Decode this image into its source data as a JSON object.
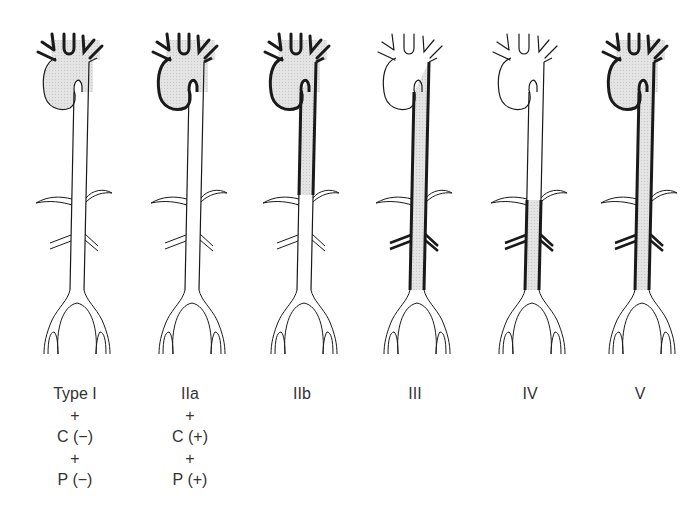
{
  "figure": {
    "colors": {
      "stroke": "#1a1a1a",
      "fill_involved": "#dcdcdc",
      "background": "#ffffff"
    }
  },
  "types": [
    {
      "id": "type-1",
      "label": "Type I",
      "lines": [
        "+",
        "C (−)",
        "+",
        "P (−)"
      ],
      "center_x": 75,
      "arch_filled": true,
      "arch_bold": false,
      "desc_filled": "none"
    },
    {
      "id": "type-2a",
      "label": "IIa",
      "lines": [
        "+",
        "C (+)",
        "+",
        "P (+)"
      ],
      "center_x": 190,
      "arch_filled": true,
      "arch_bold": true,
      "desc_filled": "none"
    },
    {
      "id": "type-2b",
      "label": "IIb",
      "lines": [],
      "center_x": 302,
      "arch_filled": true,
      "arch_bold": true,
      "desc_filled": "upper"
    },
    {
      "id": "type-3",
      "label": "III",
      "lines": [],
      "center_x": 415,
      "arch_filled": false,
      "arch_bold": false,
      "desc_filled": "full"
    },
    {
      "id": "type-4",
      "label": "IV",
      "lines": [],
      "center_x": 530,
      "arch_filled": false,
      "arch_bold": false,
      "desc_filled": "lower"
    },
    {
      "id": "type-5",
      "label": "V",
      "lines": [],
      "center_x": 640,
      "arch_filled": true,
      "arch_bold": true,
      "desc_filled": "full"
    }
  ]
}
